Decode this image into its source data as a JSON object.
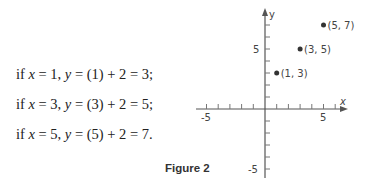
{
  "equations": [
    {
      "x": "1",
      "y_expr": "(1) + 2 = 3;"
    },
    {
      "x": "3",
      "y_expr": "(3) + 2 = 5;"
    },
    {
      "x": "5",
      "y_expr": "(5) + 2 = 7."
    }
  ],
  "eq_prefix": "if ",
  "caption": "Figure 2",
  "chart_data": {
    "type": "scatter",
    "title": "",
    "xlabel": "x",
    "ylabel": "y",
    "xlim": [
      -6,
      6.5
    ],
    "ylim": [
      -6,
      8
    ],
    "x_ticks_labeled": [
      "-5",
      "5"
    ],
    "y_ticks_labeled": [
      "5",
      "-5"
    ],
    "points": [
      {
        "x": 1,
        "y": 3,
        "label": "(1, 3)"
      },
      {
        "x": 3,
        "y": 5,
        "label": "(3, 5)"
      },
      {
        "x": 5,
        "y": 7,
        "label": "(5, 7)"
      }
    ],
    "grid": false
  }
}
